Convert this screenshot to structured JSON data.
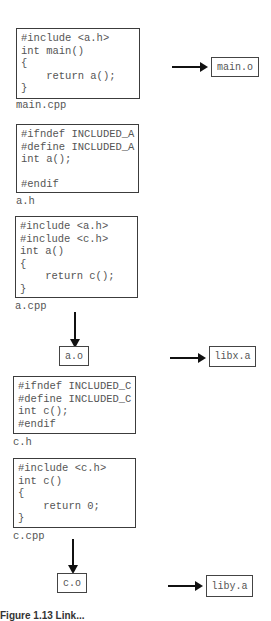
{
  "files": {
    "main_cpp": {
      "name": "main.cpp",
      "code": "#include <a.h>\nint main()\n{\n    return a();\n}"
    },
    "a_h": {
      "name": "a.h",
      "code": "#ifndef INCLUDED_A\n#define INCLUDED_A\nint a();\n\n#endif"
    },
    "a_cpp": {
      "name": "a.cpp",
      "code": "#include <a.h>\n#include <c.h>\nint a()\n{\n    return c();\n}"
    },
    "c_h": {
      "name": "c.h",
      "code": "#ifndef INCLUDED_C\n#define INCLUDED_C\nint c();\n#endif"
    },
    "c_cpp": {
      "name": "c.cpp",
      "code": "#include <c.h>\nint c()\n{\n    return 0;\n}"
    }
  },
  "objects": {
    "main_o": "main.o",
    "a_o": "a.o",
    "c_o": "c.o"
  },
  "libraries": {
    "libx_a": "libx.a",
    "liby_a": "liby.a"
  },
  "caption": "Figure 1.13 Link..."
}
